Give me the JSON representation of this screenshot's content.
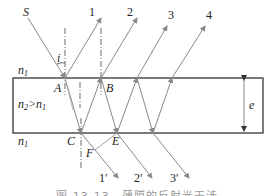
{
  "diagram": {
    "labels": {
      "S": "S",
      "i": "i",
      "A": "A",
      "B": "B",
      "C": "C",
      "E": "E",
      "F": "F",
      "e": "e",
      "n1_top": "n",
      "n1_top_sub": "1",
      "n1_bottom": "n",
      "n1_bottom_sub": "1",
      "n2_main": "n",
      "n2_sub": "2",
      "n2_gt": ">n",
      "n2_gt_sub": "1"
    },
    "reflected_rays": [
      "1",
      "2",
      "3",
      "4"
    ],
    "transmitted_rays": [
      "1′",
      "2′",
      "3′"
    ],
    "caption": "图 13-13　薄膜的反射光干涉"
  },
  "colors": {
    "film_border": "#333333",
    "ray": "#888888",
    "text": "#222222"
  }
}
